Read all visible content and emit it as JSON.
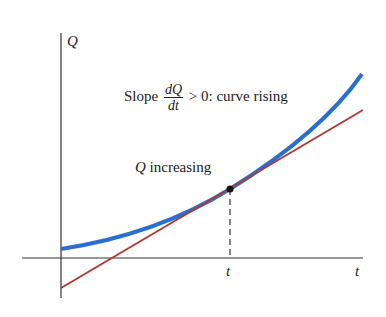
{
  "axes": {
    "y_label": "Q",
    "x_label": "t",
    "x_tick_label": "t"
  },
  "annotations": {
    "slope_prefix": "Slope",
    "slope_num": "dQ",
    "slope_den": "dt",
    "slope_suffix": "> 0: curve rising",
    "point_label_var": "Q",
    "point_label_text": " increasing"
  },
  "colors": {
    "curve": "#2a6fd0",
    "tangent": "#b03a32",
    "axes": "#333333"
  }
}
